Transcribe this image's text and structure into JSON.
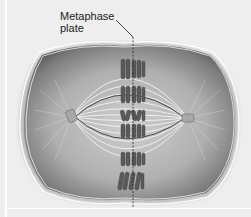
{
  "diagram": {
    "title": "Metaphase",
    "label": {
      "line1": "Metaphase",
      "line2": "plate"
    },
    "colors": {
      "background": "#eeeeee",
      "cytoplasm": "#9a9a9a",
      "membrane": "#ffffff",
      "chromosome": "#555555",
      "spindle": "#f5f5f5",
      "plate_line": "#333333"
    },
    "components": [
      "cell membrane",
      "cytoplasm",
      "spindle fibers",
      "chromosomes",
      "centrosome (left)",
      "centrosome (right)",
      "metaphase plate"
    ]
  }
}
